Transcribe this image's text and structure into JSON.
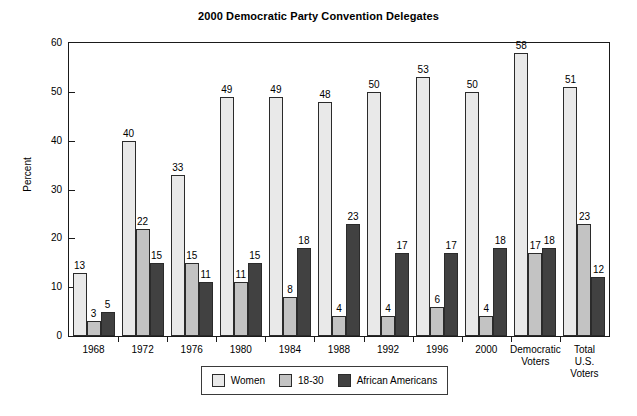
{
  "chart_data": {
    "type": "bar",
    "title": "2000 Democratic Party Convention Delegates",
    "xlabel": "",
    "ylabel": "Percent",
    "ylim": [
      0,
      60
    ],
    "yticks": [
      0,
      10,
      20,
      30,
      40,
      50,
      60
    ],
    "grid": false,
    "legend_position": "bottom-center",
    "categories": [
      "1968",
      "1972",
      "1976",
      "1980",
      "1984",
      "1988",
      "1992",
      "1996",
      "2000",
      "Democratic\nVoters",
      "Total\nU.S.\nVoters"
    ],
    "series": [
      {
        "name": "Women",
        "color": "#e9e9e9",
        "values": [
          13,
          40,
          33,
          49,
          49,
          48,
          50,
          53,
          50,
          58,
          51
        ]
      },
      {
        "name": "18-30",
        "color": "#c3c3c3",
        "values": [
          3,
          22,
          15,
          11,
          8,
          4,
          4,
          6,
          4,
          17,
          23
        ]
      },
      {
        "name": "African Americans",
        "color": "#414141",
        "values": [
          5,
          15,
          11,
          15,
          18,
          23,
          17,
          17,
          18,
          18,
          12
        ]
      }
    ]
  },
  "axis": {
    "y_title": "Percent",
    "y_tick_labels": [
      "0",
      "10",
      "20",
      "30",
      "40",
      "50",
      "60"
    ]
  },
  "legend": {
    "items": [
      {
        "label": "Women",
        "color": "#e9e9e9"
      },
      {
        "label": "18-30",
        "color": "#c3c3c3"
      },
      {
        "label": "African Americans",
        "color": "#414141"
      }
    ]
  }
}
